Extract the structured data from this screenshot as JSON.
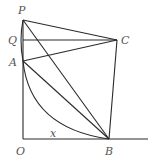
{
  "diagram": {
    "type": "geometry",
    "points": {
      "P": {
        "label": "P",
        "x": 23,
        "y": 20
      },
      "Q": {
        "label": "Q",
        "x": 23,
        "y": 40
      },
      "A": {
        "label": "A",
        "x": 23,
        "y": 61
      },
      "C": {
        "label": "C",
        "x": 117,
        "y": 40
      },
      "O": {
        "label": "O",
        "x": 23,
        "y": 139
      },
      "B": {
        "label": "B",
        "x": 109,
        "y": 139
      }
    },
    "segment_label": {
      "text": "x",
      "on": "OB"
    },
    "segments": [
      "OP",
      "OB-axis",
      "PC",
      "QC",
      "AC",
      "AB",
      "PB",
      "CB"
    ],
    "arcs": [
      "AB",
      "AP"
    ]
  }
}
